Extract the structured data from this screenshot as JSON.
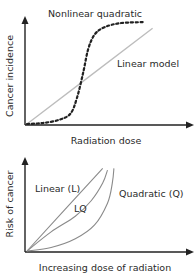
{
  "chart_data": [
    {
      "type": "line",
      "title": "Nonlinear quadratic",
      "xlabel": "Radiation dose",
      "ylabel": "Cancer incidence",
      "xlim": [
        0,
        1
      ],
      "ylim": [
        0,
        1
      ],
      "grid": false,
      "series": [
        {
          "name": "Linear model",
          "style": "solid",
          "color": "#bdbdbd",
          "x": [
            0,
            0.78
          ],
          "y": [
            0,
            0.92
          ]
        },
        {
          "name": "Nonlinear quadratic",
          "style": "dashed",
          "color": "#222222",
          "x": [
            0,
            0.1,
            0.2,
            0.27,
            0.31,
            0.35,
            0.38,
            0.42,
            0.48,
            0.58,
            0.72
          ],
          "y": [
            0,
            0.01,
            0.04,
            0.1,
            0.25,
            0.5,
            0.72,
            0.86,
            0.93,
            0.97,
            0.98
          ]
        }
      ],
      "annotations": [
        "Nonlinear quadratic",
        "Linear model"
      ]
    },
    {
      "type": "line",
      "title": "",
      "xlabel": "Increasing dose of radiation",
      "ylabel": "Risk of cancer",
      "xlim": [
        0,
        1
      ],
      "ylim": [
        0,
        1
      ],
      "grid": false,
      "series": [
        {
          "name": "Linear (L)",
          "color": "#8a8a8a",
          "x": [
            0,
            0.47
          ],
          "y": [
            0,
            0.95
          ]
        },
        {
          "name": "LQ",
          "color": "#8a8a8a",
          "x": [
            0,
            0.15,
            0.3,
            0.4,
            0.47,
            0.5
          ],
          "y": [
            0,
            0.22,
            0.4,
            0.58,
            0.78,
            0.93
          ]
        },
        {
          "name": "Quadratic (Q)",
          "color": "#8a8a8a",
          "x": [
            0,
            0.15,
            0.3,
            0.42,
            0.5,
            0.53,
            0.54
          ],
          "y": [
            0,
            0.04,
            0.14,
            0.3,
            0.55,
            0.78,
            0.95
          ]
        }
      ],
      "annotations": [
        "Linear (L)",
        "LQ",
        "Quadratic (Q)"
      ]
    }
  ]
}
